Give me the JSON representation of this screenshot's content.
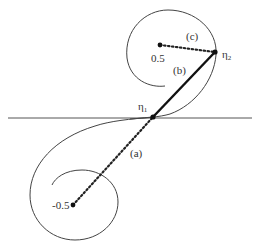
{
  "diagram": {
    "type": "clothoid-spiral-diagram",
    "colors": {
      "stroke": "#333333",
      "background": "#ffffff"
    },
    "points": {
      "center_upper": {
        "label": "0.5",
        "x": 160,
        "y": 45
      },
      "center_lower": {
        "label": "-0.5",
        "x": 73,
        "y": 205
      },
      "eta1": {
        "label": "η",
        "subscript": "1",
        "x": 153,
        "y": 117
      },
      "eta2": {
        "label": "η",
        "subscript": "2",
        "x": 215,
        "y": 52
      }
    },
    "segments": {
      "a": {
        "label": "(a)",
        "style": "dotted",
        "from": "center_lower",
        "to": "eta1"
      },
      "b": {
        "label": "(b)",
        "style": "solid-thick",
        "from": "eta1",
        "to": "eta2"
      },
      "c": {
        "label": "(c)",
        "style": "dotted",
        "from": "center_upper",
        "to": "eta2"
      }
    },
    "axis": {
      "style": "solid",
      "y": 118,
      "x_start": 8,
      "x_end": 252
    }
  }
}
